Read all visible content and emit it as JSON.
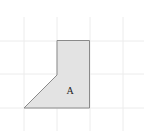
{
  "figure": {
    "shape_label": "A",
    "grid_color": "#ececec",
    "shape_fill": "#e3e3e3",
    "shape_stroke": "#8a8a8a"
  }
}
